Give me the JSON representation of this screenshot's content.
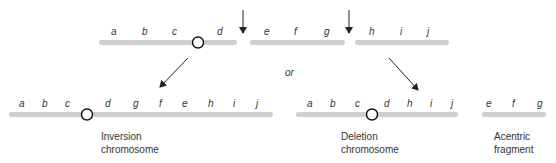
{
  "top_chromosome": {
    "segments": [
      {
        "genes": [
          "a",
          "b",
          "c",
          "d"
        ]
      },
      {
        "genes": [
          "e",
          "f",
          "g"
        ]
      },
      {
        "genes": [
          "h",
          "i",
          "j"
        ]
      }
    ],
    "break_arrows": 2
  },
  "connector_text": "or",
  "results": [
    {
      "genes": [
        "a",
        "b",
        "c",
        "d",
        "g",
        "f",
        "e",
        "h",
        "i",
        "j"
      ],
      "label_line1": "Inversion",
      "label_line2": "chromosome"
    },
    {
      "genes": [
        "a",
        "b",
        "c",
        "d",
        "h",
        "i",
        "j"
      ],
      "label_line1": "Deletion",
      "label_line2": "chromosome"
    },
    {
      "genes": [
        "e",
        "f",
        "g"
      ],
      "label_line1": "Acentric",
      "label_line2": "fragment"
    }
  ],
  "colors": {
    "chromosome": "#cfcfcf",
    "text": "#333333",
    "arrow": "#222222"
  }
}
